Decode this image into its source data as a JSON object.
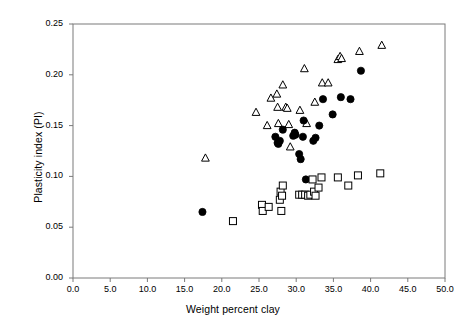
{
  "chart_data": {
    "type": "scatter",
    "title": "",
    "xlabel": "Weight percent clay",
    "ylabel": "Plasticity index (PI)",
    "xlim": [
      0.0,
      50.0
    ],
    "ylim": [
      0.0,
      0.25
    ],
    "xticks": [
      "0.0",
      "5.0",
      "10.0",
      "15.0",
      "20.0",
      "25.0",
      "30.0",
      "35.0",
      "40.0",
      "45.0",
      "50.0"
    ],
    "xtick_values": [
      0,
      5,
      10,
      15,
      20,
      25,
      30,
      35,
      40,
      45,
      50
    ],
    "yticks": [
      "0.00",
      "0.05",
      "0.10",
      "0.15",
      "0.20",
      "0.25"
    ],
    "ytick_values": [
      0.0,
      0.05,
      0.1,
      0.15,
      0.2,
      0.25
    ],
    "grid": false,
    "legend": "none",
    "frame": true,
    "series": [
      {
        "name": "triangles",
        "marker": "open-triangle",
        "color": "#000000",
        "fill": "none",
        "points": [
          [
            17.8,
            0.118
          ],
          [
            24.6,
            0.163
          ],
          [
            26.1,
            0.15
          ],
          [
            26.6,
            0.177
          ],
          [
            27.4,
            0.181
          ],
          [
            27.5,
            0.168
          ],
          [
            27.6,
            0.152
          ],
          [
            28.2,
            0.19
          ],
          [
            28.6,
            0.168
          ],
          [
            28.8,
            0.167
          ],
          [
            29.0,
            0.151
          ],
          [
            29.2,
            0.129
          ],
          [
            30.5,
            0.165
          ],
          [
            31.1,
            0.206
          ],
          [
            31.4,
            0.152
          ],
          [
            32.5,
            0.173
          ],
          [
            33.5,
            0.192
          ],
          [
            34.3,
            0.192
          ],
          [
            35.6,
            0.215
          ],
          [
            35.9,
            0.218
          ],
          [
            36.1,
            0.216
          ],
          [
            38.5,
            0.223
          ],
          [
            41.5,
            0.229
          ]
        ]
      },
      {
        "name": "circles",
        "marker": "filled-circle",
        "color": "#000000",
        "fill": "#000000",
        "points": [
          [
            17.4,
            0.065
          ],
          [
            27.2,
            0.139
          ],
          [
            27.5,
            0.133
          ],
          [
            27.6,
            0.132
          ],
          [
            27.8,
            0.135
          ],
          [
            28.2,
            0.146
          ],
          [
            29.6,
            0.14
          ],
          [
            29.8,
            0.143
          ],
          [
            29.9,
            0.141
          ],
          [
            30.4,
            0.122
          ],
          [
            30.6,
            0.117
          ],
          [
            30.9,
            0.139
          ],
          [
            31.0,
            0.155
          ],
          [
            31.3,
            0.097
          ],
          [
            32.3,
            0.135
          ],
          [
            32.6,
            0.138
          ],
          [
            33.1,
            0.15
          ],
          [
            33.6,
            0.176
          ],
          [
            34.9,
            0.161
          ],
          [
            36.0,
            0.178
          ],
          [
            37.3,
            0.176
          ],
          [
            38.7,
            0.204
          ]
        ]
      },
      {
        "name": "squares",
        "marker": "open-square",
        "color": "#000000",
        "fill": "none",
        "points": [
          [
            21.5,
            0.056
          ],
          [
            25.4,
            0.072
          ],
          [
            25.5,
            0.066
          ],
          [
            26.3,
            0.07
          ],
          [
            27.8,
            0.077
          ],
          [
            27.9,
            0.085
          ],
          [
            28.0,
            0.066
          ],
          [
            28.1,
            0.081
          ],
          [
            28.2,
            0.091
          ],
          [
            30.4,
            0.082
          ],
          [
            30.8,
            0.082
          ],
          [
            31.2,
            0.082
          ],
          [
            31.6,
            0.081
          ],
          [
            31.9,
            0.082
          ],
          [
            32.2,
            0.097
          ],
          [
            32.4,
            0.085
          ],
          [
            32.6,
            0.081
          ],
          [
            33.0,
            0.089
          ],
          [
            33.4,
            0.099
          ],
          [
            35.6,
            0.099
          ],
          [
            37.0,
            0.091
          ],
          [
            38.3,
            0.101
          ],
          [
            41.3,
            0.103
          ]
        ]
      }
    ]
  }
}
